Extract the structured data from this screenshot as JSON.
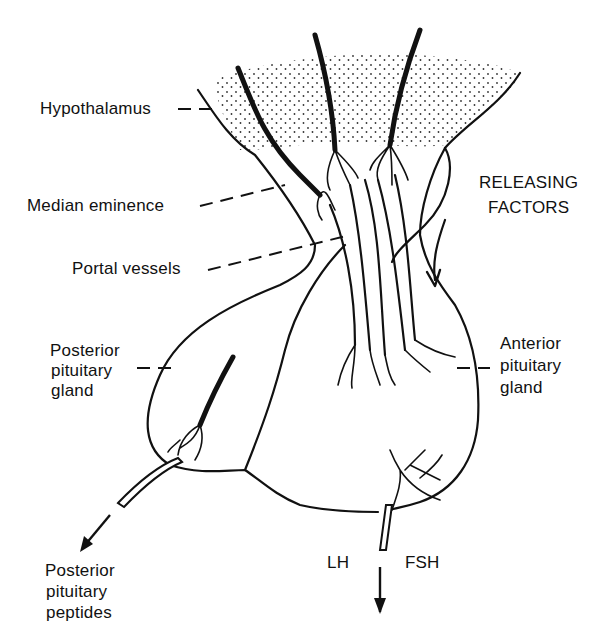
{
  "diagram": {
    "labels": {
      "hypothalamus": "Hypothalamus",
      "median_eminence": "Median eminence",
      "portal_vessels": "Portal vessels",
      "releasing_factors_line1": "RELEASING",
      "releasing_factors_line2": "FACTORS",
      "posterior_gland_line1": "Posterior",
      "posterior_gland_line2": "pituitary",
      "posterior_gland_line3": "gland",
      "anterior_gland_line1": "Anterior",
      "anterior_gland_line2": "pituitary",
      "anterior_gland_line3": "gland",
      "posterior_peptides_line1": "Posterior",
      "posterior_peptides_line2": "pituitary",
      "posterior_peptides_line3": "peptides",
      "lh": "LH",
      "fsh": "FSH"
    },
    "colors": {
      "ink": "#111111",
      "background": "#ffffff"
    }
  }
}
